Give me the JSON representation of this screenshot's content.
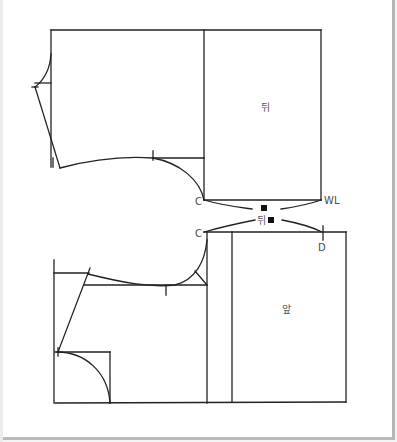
{
  "diagram": {
    "type": "sewing-pattern-draft",
    "line_color": "#222222",
    "panels": {
      "back": {
        "label": "뒤"
      },
      "front": {
        "label": "앞"
      }
    },
    "points": {
      "back_c": "C",
      "front_c": "C",
      "waistline": "WL",
      "d_point": "D"
    },
    "notch_legend": {
      "square_top": "■",
      "back_mark_label": "뒤",
      "square_bottom": "■"
    }
  }
}
